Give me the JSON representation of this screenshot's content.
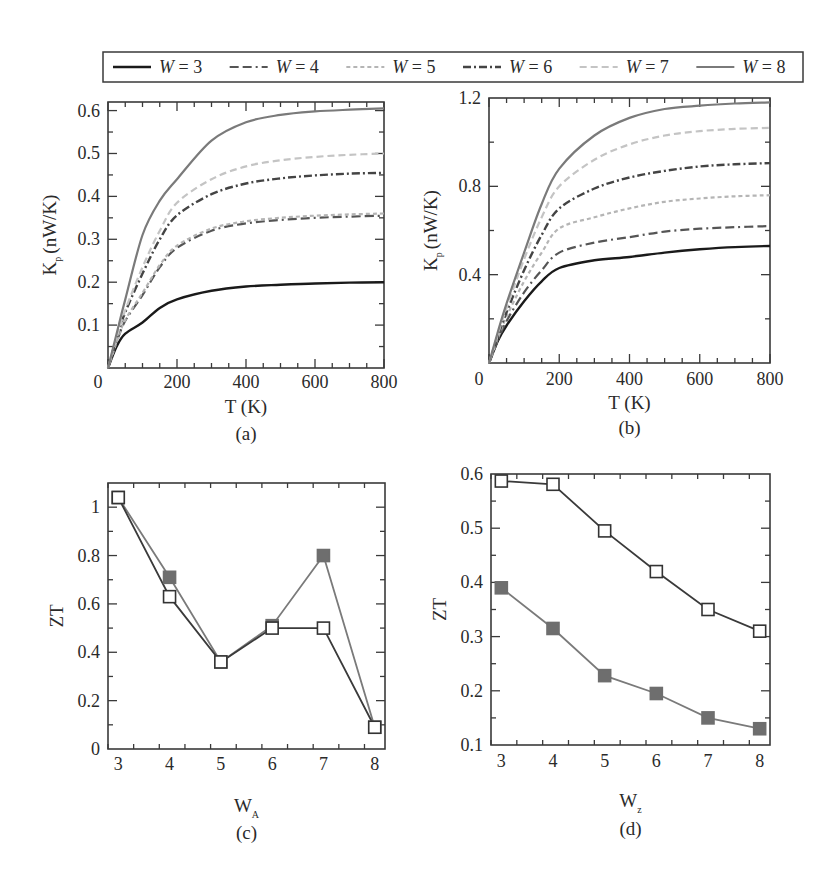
{
  "legend": {
    "entries": [
      {
        "label": "W = 3",
        "color": "#1a1a1a",
        "dash": "",
        "width": 2.4
      },
      {
        "label": "W = 4",
        "color": "#555555",
        "dash": "9,4,9,4,2,4",
        "width": 2.2
      },
      {
        "label": "W = 5",
        "color": "#b5b5b5",
        "dash": "4,3",
        "width": 2.2
      },
      {
        "label": "W = 6",
        "color": "#444444",
        "dash": "8,3,2,3",
        "width": 2.4
      },
      {
        "label": "W = 7",
        "color": "#c4c4c4",
        "dash": "7,4",
        "width": 2.2
      },
      {
        "label": "W = 8",
        "color": "#7a7a7a",
        "dash": "",
        "width": 2.2
      }
    ]
  },
  "chart_data": [
    {
      "panel": "(a)",
      "type": "line",
      "xlabel": "T (K)",
      "ylabel": "K_p (nW/K)",
      "ylabel_main": "K",
      "ylabel_sub": "p",
      "ylabel_unit": "(nW/K)",
      "xlim": [
        0,
        800
      ],
      "ylim": [
        0,
        0.62
      ],
      "xticks": [
        0,
        200,
        400,
        600,
        800
      ],
      "xtick_labels": [
        "0",
        "200",
        "400",
        "600",
        "800"
      ],
      "yticks": [
        0.1,
        0.2,
        0.3,
        0.4,
        0.5,
        0.6
      ],
      "ytick_labels": [
        "0.1",
        "0.2",
        "0.3",
        "0.4",
        "0.5",
        "0.6"
      ],
      "x": [
        0,
        25,
        50,
        100,
        150,
        200,
        300,
        400,
        500,
        600,
        700,
        800
      ],
      "series": [
        {
          "name": "W = 3",
          "values": [
            0,
            0.05,
            0.08,
            0.106,
            0.14,
            0.16,
            0.18,
            0.19,
            0.194,
            0.197,
            0.199,
            0.2
          ]
        },
        {
          "name": "W = 4",
          "values": [
            0,
            0.06,
            0.11,
            0.17,
            0.235,
            0.28,
            0.32,
            0.337,
            0.345,
            0.35,
            0.353,
            0.355
          ]
        },
        {
          "name": "W = 5",
          "values": [
            0,
            0.06,
            0.112,
            0.175,
            0.24,
            0.285,
            0.325,
            0.342,
            0.35,
            0.355,
            0.358,
            0.36
          ]
        },
        {
          "name": "W = 6",
          "values": [
            0,
            0.07,
            0.13,
            0.22,
            0.3,
            0.356,
            0.405,
            0.43,
            0.442,
            0.449,
            0.453,
            0.455
          ]
        },
        {
          "name": "W = 7",
          "values": [
            0,
            0.07,
            0.135,
            0.235,
            0.32,
            0.385,
            0.44,
            0.47,
            0.484,
            0.492,
            0.497,
            0.5
          ]
        },
        {
          "name": "W = 8",
          "values": [
            0,
            0.08,
            0.16,
            0.31,
            0.39,
            0.44,
            0.53,
            0.573,
            0.59,
            0.598,
            0.602,
            0.605
          ]
        }
      ]
    },
    {
      "panel": "(b)",
      "type": "line",
      "xlabel": "T (K)",
      "ylabel": "K_p (nW/K)",
      "ylabel_main": "K",
      "ylabel_sub": "p",
      "ylabel_unit": "(nW/K)",
      "xlim": [
        0,
        800
      ],
      "ylim": [
        0,
        1.2
      ],
      "xticks": [
        0,
        200,
        400,
        600,
        800
      ],
      "xtick_labels": [
        "0",
        "200",
        "400",
        "600",
        "800"
      ],
      "yticks": [
        0.4,
        0.8,
        1.2
      ],
      "ytick_labels": [
        "0.4",
        "0.8",
        "1.2"
      ],
      "x": [
        0,
        25,
        50,
        100,
        150,
        200,
        300,
        400,
        500,
        600,
        700,
        800
      ],
      "series": [
        {
          "name": "W = 3",
          "values": [
            0,
            0.1,
            0.17,
            0.28,
            0.37,
            0.43,
            0.465,
            0.48,
            0.5,
            0.515,
            0.525,
            0.53
          ]
        },
        {
          "name": "W = 4",
          "values": [
            0,
            0.1,
            0.19,
            0.32,
            0.42,
            0.5,
            0.545,
            0.57,
            0.595,
            0.608,
            0.615,
            0.62
          ]
        },
        {
          "name": "W = 5",
          "values": [
            0,
            0.11,
            0.21,
            0.37,
            0.5,
            0.61,
            0.66,
            0.7,
            0.73,
            0.745,
            0.755,
            0.76
          ]
        },
        {
          "name": "W = 6",
          "values": [
            0,
            0.12,
            0.23,
            0.42,
            0.58,
            0.7,
            0.79,
            0.84,
            0.87,
            0.89,
            0.9,
            0.905
          ]
        },
        {
          "name": "W = 7",
          "values": [
            0,
            0.13,
            0.25,
            0.47,
            0.66,
            0.8,
            0.92,
            0.99,
            1.03,
            1.05,
            1.06,
            1.065
          ]
        },
        {
          "name": "W = 8",
          "values": [
            0,
            0.14,
            0.27,
            0.5,
            0.72,
            0.88,
            1.03,
            1.11,
            1.15,
            1.165,
            1.175,
            1.18
          ]
        }
      ]
    },
    {
      "panel": "(c)",
      "type": "line",
      "xlabel": "W_A",
      "xlabel_main": "W",
      "xlabel_sub": "A",
      "ylabel": "ZT",
      "xlim": [
        2.8,
        8.2
      ],
      "ylim": [
        0,
        1.1
      ],
      "xticks": [
        3,
        4,
        5,
        6,
        7,
        8
      ],
      "xtick_labels": [
        "3",
        "4",
        "5",
        "6",
        "7",
        "8"
      ],
      "yticks": [
        0,
        0.2,
        0.4,
        0.6,
        0.8,
        1
      ],
      "ytick_labels": [
        "0",
        "0.2",
        "0.4",
        "0.6",
        "0.8",
        "1"
      ],
      "x": [
        3,
        4,
        5,
        6,
        7,
        8
      ],
      "series": [
        {
          "name": "open squares",
          "marker": "open-square",
          "values": [
            1.04,
            0.63,
            0.36,
            0.5,
            0.5,
            0.09
          ]
        },
        {
          "name": "filled squares",
          "marker": "filled-square",
          "values": [
            1.04,
            0.71,
            0.36,
            0.51,
            0.8,
            0.09
          ]
        }
      ]
    },
    {
      "panel": "(d)",
      "type": "line",
      "xlabel": "W_z",
      "xlabel_main": "W",
      "xlabel_sub": "z",
      "ylabel": "ZT",
      "xlim": [
        2.8,
        8.2
      ],
      "ylim": [
        0.1,
        0.6
      ],
      "xticks": [
        3,
        4,
        5,
        6,
        7,
        8
      ],
      "xtick_labels": [
        "3",
        "4",
        "5",
        "6",
        "7",
        "8"
      ],
      "yticks": [
        0.1,
        0.2,
        0.3,
        0.4,
        0.5,
        0.6
      ],
      "ytick_labels": [
        "0.1",
        "0.2",
        "0.3",
        "0.4",
        "0.5",
        "0.6"
      ],
      "x": [
        3,
        4,
        5,
        6,
        7,
        8
      ],
      "series": [
        {
          "name": "open squares",
          "marker": "open-square",
          "values": [
            0.587,
            0.581,
            0.495,
            0.42,
            0.35,
            0.31
          ]
        },
        {
          "name": "filled squares",
          "marker": "filled-square",
          "values": [
            0.39,
            0.315,
            0.228,
            0.195,
            0.15,
            0.13
          ]
        }
      ]
    }
  ],
  "panels_layout": [
    {
      "left": 108,
      "top": 102,
      "right": 384,
      "bottom": 368,
      "caption_y": 440,
      "xlabel_y": 413,
      "ticklabel_y": 388
    },
    {
      "left": 489,
      "top": 98,
      "right": 770,
      "bottom": 363,
      "caption_y": 434,
      "xlabel_y": 409,
      "ticklabel_y": 385
    },
    {
      "left": 108,
      "top": 483,
      "right": 385,
      "bottom": 749,
      "caption_y": 839,
      "xlabel_y": 812,
      "ticklabel_y": 770
    },
    {
      "left": 491,
      "top": 474,
      "right": 770,
      "bottom": 745,
      "caption_y": 835,
      "xlabel_y": 807,
      "ticklabel_y": 767
    }
  ],
  "colors": {
    "axis": "#3a3a3a",
    "open_marker_stroke": "#333333",
    "open_line": "#3a3a3a",
    "filled_marker": "#6e6e6e",
    "filled_line": "#7a7a7a"
  }
}
